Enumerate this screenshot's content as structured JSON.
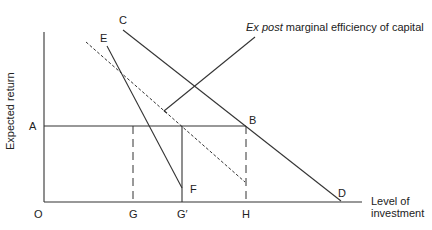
{
  "diagram": {
    "axes": {
      "y_label": "Expected return",
      "x_label_line1": "Level of",
      "x_label_line2": "investment",
      "origin_label": "O"
    },
    "points": {
      "A": "A",
      "B": "B",
      "C": "C",
      "D": "D",
      "E": "E",
      "F": "F",
      "G": "G",
      "G_prime": "G′",
      "H": "H"
    },
    "annotation": {
      "italic_part": "Ex post",
      "rest": " marginal efficiency of capital"
    },
    "colors": {
      "line": "#333333",
      "background": "#ffffff"
    }
  }
}
